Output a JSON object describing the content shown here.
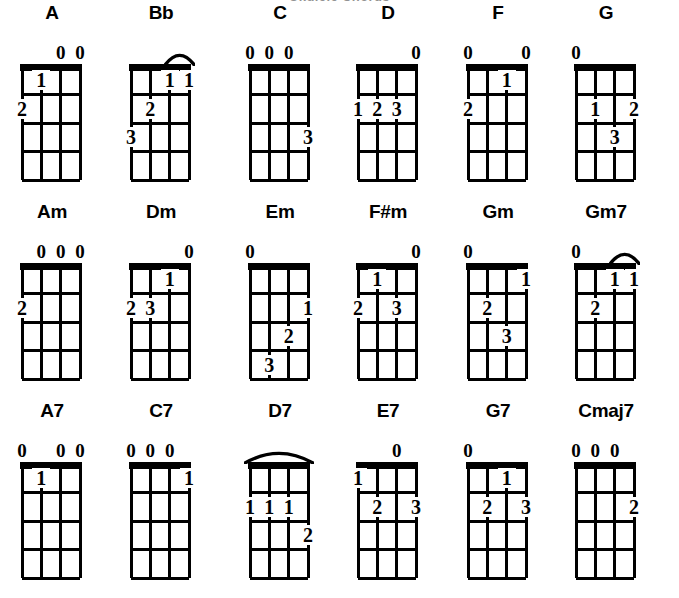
{
  "page": {
    "clipped_heading": "Ukulele Chords",
    "columns": 6,
    "rows": 3,
    "strings": 4,
    "frets": 4,
    "ink_color": "#000000",
    "background_color": "#ffffff",
    "open_symbol": "0"
  },
  "rows": [
    {
      "name": "major-chords-row",
      "chords": [
        {
          "name": "A",
          "open_strings": [
            3,
            4
          ],
          "barre": null,
          "fingers": [
            {
              "label": "1",
              "fret": 1,
              "string": 2
            },
            {
              "label": "2",
              "fret": 2,
              "string": 1
            }
          ]
        },
        {
          "name": "Bb",
          "open_strings": [],
          "barre": {
            "from_string": 3,
            "to_string": 4
          },
          "fingers": [
            {
              "label": "1",
              "fret": 1,
              "string": 3
            },
            {
              "label": "1",
              "fret": 1,
              "string": 4
            },
            {
              "label": "2",
              "fret": 2,
              "string": 2
            },
            {
              "label": "3",
              "fret": 3,
              "string": 1
            }
          ]
        },
        {
          "name": "C",
          "open_strings": [
            1,
            2,
            3
          ],
          "barre": null,
          "fingers": [
            {
              "label": "3",
              "fret": 3,
              "string": 4
            }
          ]
        },
        {
          "name": "D",
          "open_strings": [
            4
          ],
          "barre": null,
          "fingers": [
            {
              "label": "1",
              "fret": 2,
              "string": 1
            },
            {
              "label": "2",
              "fret": 2,
              "string": 2
            },
            {
              "label": "3",
              "fret": 2,
              "string": 3
            }
          ]
        },
        {
          "name": "F",
          "open_strings": [
            1,
            4
          ],
          "barre": null,
          "fingers": [
            {
              "label": "1",
              "fret": 1,
              "string": 3
            },
            {
              "label": "2",
              "fret": 2,
              "string": 1
            }
          ]
        },
        {
          "name": "G",
          "open_strings": [
            1
          ],
          "barre": null,
          "fingers": [
            {
              "label": "1",
              "fret": 2,
              "string": 2
            },
            {
              "label": "2",
              "fret": 2,
              "string": 4
            },
            {
              "label": "3",
              "fret": 3,
              "string": 3
            }
          ]
        }
      ]
    },
    {
      "name": "minor-chords-row",
      "chords": [
        {
          "name": "Am",
          "open_strings": [
            2,
            3,
            4
          ],
          "barre": null,
          "fingers": [
            {
              "label": "2",
              "fret": 2,
              "string": 1
            }
          ]
        },
        {
          "name": "Dm",
          "open_strings": [
            4
          ],
          "barre": null,
          "fingers": [
            {
              "label": "1",
              "fret": 1,
              "string": 3
            },
            {
              "label": "2",
              "fret": 2,
              "string": 1
            },
            {
              "label": "3",
              "fret": 2,
              "string": 2
            }
          ]
        },
        {
          "name": "Em",
          "open_strings": [
            1
          ],
          "barre": null,
          "fingers": [
            {
              "label": "1",
              "fret": 2,
              "string": 4
            },
            {
              "label": "2",
              "fret": 3,
              "string": 3
            },
            {
              "label": "3",
              "fret": 4,
              "string": 2
            }
          ]
        },
        {
          "name": "F#m",
          "open_strings": [
            4
          ],
          "barre": null,
          "fingers": [
            {
              "label": "1",
              "fret": 1,
              "string": 2
            },
            {
              "label": "2",
              "fret": 2,
              "string": 1
            },
            {
              "label": "3",
              "fret": 2,
              "string": 3
            }
          ]
        },
        {
          "name": "Gm",
          "open_strings": [
            1
          ],
          "barre": null,
          "fingers": [
            {
              "label": "1",
              "fret": 1,
              "string": 4
            },
            {
              "label": "2",
              "fret": 2,
              "string": 2
            },
            {
              "label": "3",
              "fret": 3,
              "string": 3
            }
          ]
        },
        {
          "name": "Gm7",
          "open_strings": [
            1
          ],
          "barre": {
            "from_string": 3,
            "to_string": 4
          },
          "fingers": [
            {
              "label": "1",
              "fret": 1,
              "string": 3
            },
            {
              "label": "1",
              "fret": 1,
              "string": 4
            },
            {
              "label": "2",
              "fret": 2,
              "string": 2
            }
          ]
        }
      ]
    },
    {
      "name": "seventh-chords-row",
      "chords": [
        {
          "name": "A7",
          "open_strings": [
            1,
            3,
            4
          ],
          "barre": null,
          "fingers": [
            {
              "label": "1",
              "fret": 1,
              "string": 2
            }
          ]
        },
        {
          "name": "C7",
          "open_strings": [
            1,
            2,
            3
          ],
          "barre": null,
          "fingers": [
            {
              "label": "1",
              "fret": 1,
              "string": 4
            }
          ]
        },
        {
          "name": "D7",
          "open_strings": [],
          "barre": {
            "from_string": 1,
            "to_string": 4
          },
          "fingers": [
            {
              "label": "1",
              "fret": 2,
              "string": 1
            },
            {
              "label": "1",
              "fret": 2,
              "string": 2
            },
            {
              "label": "1",
              "fret": 2,
              "string": 3
            },
            {
              "label": "2",
              "fret": 3,
              "string": 4
            }
          ]
        },
        {
          "name": "E7",
          "open_strings": [
            3
          ],
          "barre": null,
          "fingers": [
            {
              "label": "1",
              "fret": 1,
              "string": 1
            },
            {
              "label": "2",
              "fret": 2,
              "string": 2
            },
            {
              "label": "3",
              "fret": 2,
              "string": 4
            }
          ]
        },
        {
          "name": "G7",
          "open_strings": [
            1
          ],
          "barre": null,
          "fingers": [
            {
              "label": "1",
              "fret": 1,
              "string": 3
            },
            {
              "label": "2",
              "fret": 2,
              "string": 2
            },
            {
              "label": "3",
              "fret": 2,
              "string": 4
            }
          ]
        },
        {
          "name": "Cmaj7",
          "open_strings": [
            1,
            2,
            3
          ],
          "barre": null,
          "fingers": [
            {
              "label": "2",
              "fret": 2,
              "string": 4
            }
          ]
        }
      ]
    }
  ]
}
